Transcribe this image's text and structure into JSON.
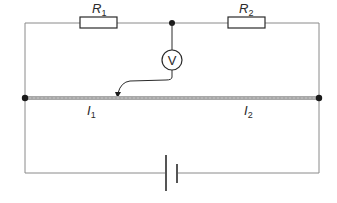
{
  "diagram": {
    "type": "circuit",
    "components": {
      "r1": {
        "symbol": "R",
        "subscript": "1"
      },
      "r2": {
        "symbol": "R",
        "subscript": "2"
      },
      "voltmeter": {
        "label": "V"
      },
      "wire_section_1": {
        "symbol": "I",
        "subscript": "1"
      },
      "wire_section_2": {
        "symbol": "I",
        "subscript": "2"
      },
      "battery": {
        "type": "cell"
      }
    },
    "colors": {
      "wire": "#8a8a8a",
      "resistance_wire": "#a8a8a8",
      "stroke": "#2a2a2a",
      "node": "#1a1a1a"
    }
  }
}
